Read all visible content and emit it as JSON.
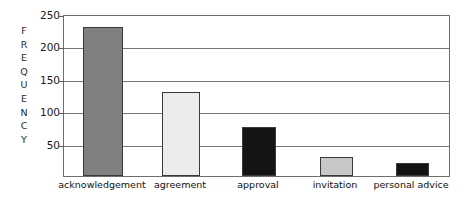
{
  "chart_data": {
    "type": "bar",
    "title": "",
    "xlabel": "",
    "ylabel": "FREQUENCY",
    "ylim": [
      0,
      250
    ],
    "yticks": [
      50,
      100,
      150,
      200,
      250
    ],
    "grid": true,
    "legend": false,
    "categories": [
      "acknowledgement",
      "agreement",
      "approval",
      "invitation",
      "personal advice"
    ],
    "values": [
      230,
      130,
      75,
      30,
      20
    ],
    "bar_colors": [
      "#808080",
      "#ececec",
      "#141414",
      "#c8c8c8",
      "#141414"
    ],
    "bar_border_color": "#3a3a3a"
  },
  "axis": {
    "y_title_letters": [
      "F",
      "R",
      "E",
      "Q",
      "U",
      "E",
      "N",
      "C",
      "Y"
    ],
    "tick_labels": [
      "250",
      "200",
      "150",
      "100",
      "50"
    ]
  },
  "colors": {
    "background": "#ffffff",
    "frame": "#6e6e6e",
    "gridline": "#787878",
    "text": "#111111"
  }
}
